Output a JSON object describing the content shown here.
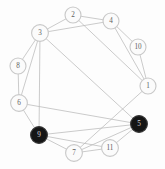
{
  "diagram": {
    "width": 165,
    "height": 169,
    "background_color": "#fdfdfd",
    "edge_color": "#b9b9b9",
    "node_open_fill": "#fbfbfb",
    "node_open_stroke": "#c9c9c9",
    "node_filled_fill": "#151515",
    "label_open_color": "#5e5e5e",
    "label_filled_color": "#d8d8d8"
  },
  "chart_data": {
    "type": "diagram",
    "layout": "circular",
    "nodes": [
      {
        "id": "1",
        "label": "1",
        "x": 148,
        "y": 86,
        "r": 8.0,
        "state": "open"
      },
      {
        "id": "2",
        "label": "2",
        "x": 73,
        "y": 15,
        "r": 8.0,
        "state": "open"
      },
      {
        "id": "3",
        "label": "3",
        "x": 40,
        "y": 33,
        "r": 8.4,
        "state": "open"
      },
      {
        "id": "4",
        "label": "4",
        "x": 111,
        "y": 21,
        "r": 8.0,
        "state": "open"
      },
      {
        "id": "5",
        "label": "5",
        "x": 139,
        "y": 124,
        "r": 8.4,
        "state": "filled"
      },
      {
        "id": "6",
        "label": "6",
        "x": 19,
        "y": 103,
        "r": 8.4,
        "state": "open"
      },
      {
        "id": "7",
        "label": "7",
        "x": 74,
        "y": 153,
        "r": 8.4,
        "state": "open"
      },
      {
        "id": "8",
        "label": "8",
        "x": 18,
        "y": 66,
        "r": 8.0,
        "state": "open"
      },
      {
        "id": "9",
        "label": "9",
        "x": 39,
        "y": 135,
        "r": 8.4,
        "state": "filled"
      },
      {
        "id": "10",
        "label": "10",
        "x": 138,
        "y": 47,
        "r": 8.0,
        "state": "open"
      },
      {
        "id": "11",
        "label": "11",
        "x": 110,
        "y": 148,
        "r": 8.4,
        "state": "open"
      }
    ],
    "edges": [
      {
        "source": "3",
        "target": "2"
      },
      {
        "source": "3",
        "target": "4"
      },
      {
        "source": "3",
        "target": "8"
      },
      {
        "source": "3",
        "target": "9"
      },
      {
        "source": "3",
        "target": "5"
      },
      {
        "source": "3",
        "target": "6"
      },
      {
        "source": "2",
        "target": "4"
      },
      {
        "source": "2",
        "target": "1"
      },
      {
        "source": "4",
        "target": "10"
      },
      {
        "source": "4",
        "target": "1"
      },
      {
        "source": "10",
        "target": "1"
      },
      {
        "source": "1",
        "target": "7"
      },
      {
        "source": "8",
        "target": "6"
      },
      {
        "source": "6",
        "target": "9"
      },
      {
        "source": "6",
        "target": "5"
      },
      {
        "source": "9",
        "target": "7"
      },
      {
        "source": "9",
        "target": "11"
      },
      {
        "source": "9",
        "target": "5"
      },
      {
        "source": "7",
        "target": "11"
      },
      {
        "source": "7",
        "target": "5"
      },
      {
        "source": "11",
        "target": "5"
      }
    ],
    "node_count": 11,
    "edge_count": 21,
    "filled_nodes": [
      "5",
      "9"
    ],
    "legend": [],
    "xlabel": "",
    "ylabel": "",
    "title": ""
  }
}
